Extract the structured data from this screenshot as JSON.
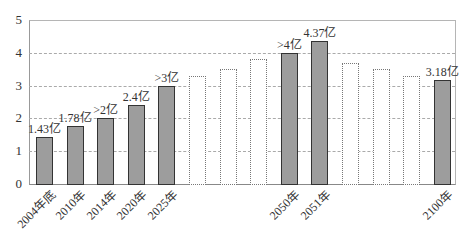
{
  "chart_data": {
    "type": "bar",
    "title": "",
    "xlabel": "",
    "ylabel": "",
    "ylim": [
      0,
      5
    ],
    "yticks": [
      "0",
      "1",
      "2",
      "3",
      "4",
      "5"
    ],
    "grid": "horizontal dashed",
    "legend": "none",
    "categories": [
      "2004年底",
      "2010年",
      "2014年",
      "2020年",
      "2025年",
      "",
      "",
      "",
      "2050年",
      "2051年",
      "",
      "",
      "",
      "2100年"
    ],
    "values": [
      1.43,
      1.78,
      2.0,
      2.4,
      3.0,
      3.3,
      3.5,
      3.8,
      4.0,
      4.37,
      3.7,
      3.5,
      3.3,
      3.18
    ],
    "styles": [
      "solid",
      "solid",
      "solid",
      "solid",
      "solid",
      "dotted",
      "dotted",
      "dotted",
      "solid",
      "solid",
      "dotted",
      "dotted",
      "dotted",
      "solid"
    ],
    "data_labels": [
      "1.43亿",
      "1.78亿",
      ">2亿",
      "2.4亿",
      ">3亿",
      "",
      "",
      "",
      ">4亿",
      "4.37亿",
      "",
      "",
      "",
      "3.18亿"
    ]
  },
  "colors": {
    "bar_fill": "#9d9d9d",
    "bar_border": "#333333",
    "grid": "#aaaaaa"
  }
}
